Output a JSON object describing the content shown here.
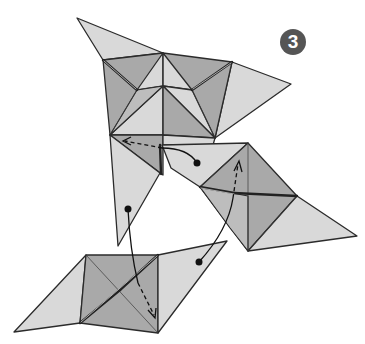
{
  "diagram": {
    "type": "origami-instruction-step",
    "step_number": "3",
    "colors": {
      "background": "#ffffff",
      "paper_light": "#d9d9d9",
      "paper_dark": "#a9a9a9",
      "outline": "#2b2b2b",
      "badge": "#555555",
      "badge_text": "#ffffff"
    },
    "modules": [
      {
        "name": "top-module",
        "description": "star-shaped folded unit with two flaps"
      },
      {
        "name": "right-module",
        "description": "square pyramid unit with right triangular flap"
      },
      {
        "name": "bottom-module",
        "description": "square pyramid unit with left and right flaps"
      }
    ],
    "arrows": [
      {
        "name": "arrow-right-to-top",
        "from": "dot on right module flap",
        "to": "top module pocket",
        "style": "curved, dashed tip"
      },
      {
        "name": "arrow-top-to-bottom",
        "from": "dot on top module lower flap",
        "to": "bottom module pocket",
        "style": "curved, dashed tip"
      },
      {
        "name": "arrow-bottom-to-right",
        "from": "dot on bottom module flap",
        "to": "right module pocket",
        "style": "curved, dashed tip"
      }
    ]
  }
}
